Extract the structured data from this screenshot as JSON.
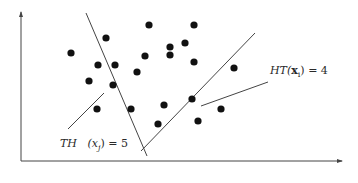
{
  "figure": {
    "axes": {
      "origin": [
        21,
        161
      ],
      "y_axis_top": [
        21,
        12
      ],
      "x_axis_end": [
        342,
        161
      ],
      "color": "#444444"
    },
    "lines": [
      {
        "name": "line-th",
        "from": [
          86,
          13
        ],
        "to": [
          147,
          156
        ],
        "color": "#444444"
      },
      {
        "name": "line-ht",
        "from": [
          141,
          151
        ],
        "to": [
          255,
          33
        ],
        "color": "#444444"
      },
      {
        "name": "leader-th",
        "from": [
          68,
          129
        ],
        "to": [
          104,
          93
        ],
        "color": "#444444"
      },
      {
        "name": "leader-ht",
        "from": [
          201,
          106
        ],
        "to": [
          268,
          82
        ],
        "color": "#444444"
      }
    ],
    "points": [
      [
        71,
        53
      ],
      [
        106,
        38
      ],
      [
        149,
        25
      ],
      [
        194,
        25
      ],
      [
        98,
        65
      ],
      [
        115,
        65
      ],
      [
        89,
        81
      ],
      [
        113,
        85
      ],
      [
        145,
        56
      ],
      [
        137,
        72
      ],
      [
        170,
        47
      ],
      [
        185,
        43
      ],
      [
        170,
        55
      ],
      [
        194,
        62
      ],
      [
        97,
        109
      ],
      [
        131,
        109
      ],
      [
        164,
        105
      ],
      [
        158,
        124
      ],
      [
        192,
        99
      ],
      [
        221,
        109
      ],
      [
        198,
        121
      ],
      [
        234,
        68
      ]
    ],
    "point_radius": 3.6,
    "point_color": "#111111"
  },
  "labels": {
    "th": {
      "text": "TH   (xⱼ) = 5",
      "prefix": "TH",
      "arg": "(x",
      "sub": "j",
      "rest": ") = 5",
      "x": 60,
      "y": 137
    },
    "ht": {
      "prefix": "HT(",
      "bold": "x",
      "sub": "i",
      "rest": ") = 4",
      "x": 270,
      "y": 64
    }
  }
}
